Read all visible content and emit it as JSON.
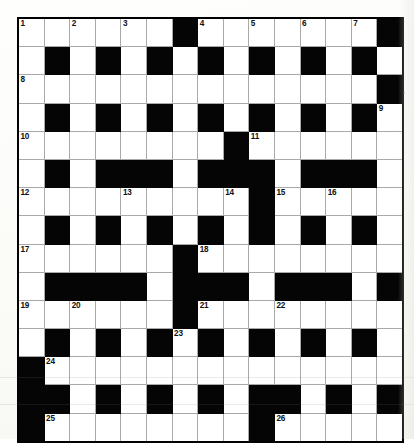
{
  "document": {
    "type": "crossword-puzzle-grid",
    "title": "Crossword Puzzle",
    "rows": 15,
    "columns": 15,
    "colors": {
      "block": "#050505",
      "cell": "#ffffff",
      "grid_line": "#a9a9a9",
      "border": "#000000",
      "page": "#fdfdfb"
    }
  },
  "grid": {
    "legend": {
      "0": "white-cell",
      "1": "black-cell"
    },
    "cells": [
      [
        0,
        0,
        0,
        0,
        0,
        0,
        1,
        0,
        0,
        0,
        0,
        0,
        0,
        0,
        1
      ],
      [
        0,
        1,
        0,
        1,
        0,
        1,
        0,
        1,
        0,
        1,
        0,
        1,
        0,
        1,
        0
      ],
      [
        0,
        0,
        0,
        0,
        0,
        0,
        0,
        0,
        0,
        0,
        0,
        0,
        0,
        0,
        1
      ],
      [
        0,
        1,
        0,
        1,
        0,
        1,
        0,
        1,
        0,
        1,
        0,
        1,
        0,
        1,
        0
      ],
      [
        0,
        0,
        0,
        0,
        0,
        0,
        0,
        0,
        1,
        0,
        0,
        0,
        0,
        0,
        0
      ],
      [
        0,
        1,
        0,
        1,
        1,
        1,
        0,
        1,
        1,
        1,
        0,
        1,
        1,
        1,
        0
      ],
      [
        0,
        0,
        0,
        0,
        0,
        0,
        0,
        0,
        0,
        1,
        0,
        0,
        0,
        0,
        0
      ],
      [
        0,
        1,
        0,
        1,
        0,
        1,
        0,
        1,
        0,
        1,
        0,
        1,
        0,
        1,
        0
      ],
      [
        0,
        0,
        0,
        0,
        0,
        0,
        1,
        0,
        0,
        0,
        0,
        0,
        0,
        0,
        0
      ],
      [
        0,
        1,
        1,
        1,
        1,
        0,
        1,
        1,
        1,
        0,
        1,
        1,
        1,
        0,
        1
      ],
      [
        0,
        0,
        0,
        0,
        0,
        0,
        1,
        0,
        0,
        0,
        0,
        0,
        0,
        0,
        0
      ],
      [
        0,
        1,
        0,
        1,
        0,
        1,
        0,
        1,
        0,
        1,
        0,
        1,
        0,
        1,
        0
      ],
      [
        1,
        0,
        0,
        0,
        0,
        0,
        0,
        0,
        0,
        0,
        0,
        0,
        0,
        0,
        0
      ],
      [
        1,
        1,
        0,
        1,
        0,
        1,
        0,
        1,
        0,
        1,
        1,
        0,
        1,
        0,
        1
      ],
      [
        1,
        0,
        0,
        0,
        0,
        0,
        0,
        0,
        0,
        1,
        0,
        0,
        0,
        0,
        0
      ]
    ],
    "numbers": [
      {
        "number": "1",
        "row": 0,
        "col": 0
      },
      {
        "number": "2",
        "row": 0,
        "col": 2
      },
      {
        "number": "3",
        "row": 0,
        "col": 4
      },
      {
        "number": "4",
        "row": 0,
        "col": 7
      },
      {
        "number": "5",
        "row": 0,
        "col": 9
      },
      {
        "number": "6",
        "row": 0,
        "col": 11
      },
      {
        "number": "7",
        "row": 0,
        "col": 13
      },
      {
        "number": "8",
        "row": 2,
        "col": 0
      },
      {
        "number": "9",
        "row": 3,
        "col": 14
      },
      {
        "number": "10",
        "row": 4,
        "col": 0
      },
      {
        "number": "11",
        "row": 4,
        "col": 9
      },
      {
        "number": "12",
        "row": 6,
        "col": 0
      },
      {
        "number": "13",
        "row": 6,
        "col": 4
      },
      {
        "number": "14",
        "row": 6,
        "col": 8
      },
      {
        "number": "15",
        "row": 6,
        "col": 10
      },
      {
        "number": "16",
        "row": 6,
        "col": 12
      },
      {
        "number": "17",
        "row": 8,
        "col": 0
      },
      {
        "number": "18",
        "row": 8,
        "col": 7
      },
      {
        "number": "19",
        "row": 10,
        "col": 0
      },
      {
        "number": "20",
        "row": 10,
        "col": 2
      },
      {
        "number": "21",
        "row": 10,
        "col": 7
      },
      {
        "number": "22",
        "row": 10,
        "col": 10
      },
      {
        "number": "23",
        "row": 11,
        "col": 6
      },
      {
        "number": "24",
        "row": 12,
        "col": 1
      },
      {
        "number": "25",
        "row": 14,
        "col": 1
      },
      {
        "number": "26",
        "row": 14,
        "col": 10
      }
    ]
  }
}
